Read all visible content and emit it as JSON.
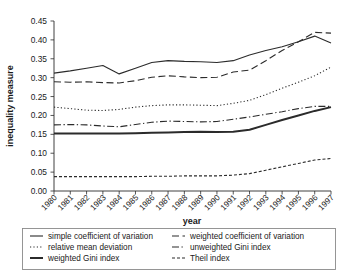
{
  "chart_data": {
    "type": "line",
    "title": "",
    "xlabel": "year",
    "ylabel": "inequality measure",
    "grid": false,
    "legend_position": "bottom",
    "xlim": [
      1980,
      1997
    ],
    "ylim": [
      0.0,
      0.45
    ],
    "ytick_step": 0.05,
    "yticks": [
      "0.00",
      "0.05",
      "0.10",
      "0.15",
      "0.20",
      "0.25",
      "0.30",
      "0.35",
      "0.40",
      "0.45"
    ],
    "categories": [
      1980,
      1981,
      1982,
      1983,
      1984,
      1985,
      1986,
      1987,
      1988,
      1989,
      1990,
      1991,
      1992,
      1993,
      1994,
      1995,
      1996,
      1997
    ],
    "xtick_labels": [
      "1980",
      "1981",
      "1982",
      "1983",
      "1984",
      "1985",
      "1986",
      "1987",
      "1988",
      "1989",
      "1990",
      "1991",
      "1992",
      "1993",
      "1994",
      "1995",
      "1996",
      "1997"
    ],
    "series": [
      {
        "name": "simple coefficient of variation",
        "style": "solid",
        "linewidth": 1.1,
        "color": "#2b2b2b",
        "values": [
          0.312,
          0.318,
          0.325,
          0.332,
          0.31,
          0.325,
          0.34,
          0.345,
          0.343,
          0.342,
          0.34,
          0.345,
          0.36,
          0.372,
          0.382,
          0.395,
          0.41,
          0.392
        ]
      },
      {
        "name": "weighted coefficient of variation",
        "style": "dashed",
        "linewidth": 1.1,
        "color": "#2b2b2b",
        "values": [
          0.289,
          0.288,
          0.289,
          0.287,
          0.286,
          0.292,
          0.301,
          0.305,
          0.302,
          0.3,
          0.301,
          0.315,
          0.32,
          0.345,
          0.372,
          0.395,
          0.42,
          0.418
        ]
      },
      {
        "name": "relative mean deviation",
        "style": "dotted",
        "linewidth": 1.1,
        "color": "#2b2b2b",
        "values": [
          0.222,
          0.218,
          0.214,
          0.213,
          0.216,
          0.222,
          0.226,
          0.228,
          0.228,
          0.227,
          0.226,
          0.232,
          0.24,
          0.255,
          0.272,
          0.288,
          0.305,
          0.328
        ]
      },
      {
        "name": "unweighted Gini index",
        "style": "dashdot",
        "linewidth": 1.1,
        "color": "#2b2b2b",
        "values": [
          0.175,
          0.176,
          0.175,
          0.172,
          0.17,
          0.176,
          0.182,
          0.185,
          0.184,
          0.183,
          0.184,
          0.19,
          0.196,
          0.203,
          0.21,
          0.218,
          0.224,
          0.224
        ]
      },
      {
        "name": "weighted Gini index",
        "style": "solid",
        "linewidth": 2.0,
        "color": "#3c3c3c",
        "values": [
          0.152,
          0.152,
          0.152,
          0.152,
          0.152,
          0.153,
          0.154,
          0.155,
          0.156,
          0.157,
          0.156,
          0.157,
          0.162,
          0.175,
          0.188,
          0.2,
          0.212,
          0.222
        ]
      },
      {
        "name": "Theil index",
        "style": "finedash",
        "linewidth": 1.1,
        "color": "#2b2b2b",
        "values": [
          0.038,
          0.038,
          0.038,
          0.038,
          0.038,
          0.038,
          0.039,
          0.039,
          0.04,
          0.04,
          0.04,
          0.042,
          0.046,
          0.055,
          0.064,
          0.073,
          0.082,
          0.086
        ]
      }
    ]
  },
  "legend": {
    "entries": [
      {
        "label": "simple coefficient of variation",
        "style": "solid"
      },
      {
        "label": "weighted coefficient of variation",
        "style": "dashed"
      },
      {
        "label": "relative mean deviation",
        "style": "dotted"
      },
      {
        "label": "unweighted Gini index",
        "style": "dashdot"
      },
      {
        "label": "weighted Gini index",
        "style": "thicksolid"
      },
      {
        "label": "Theil index",
        "style": "finedash"
      }
    ]
  },
  "colors": {
    "ink": "#2b2b2b",
    "legend_border": "#8a8a8a",
    "background": "#ffffff"
  }
}
